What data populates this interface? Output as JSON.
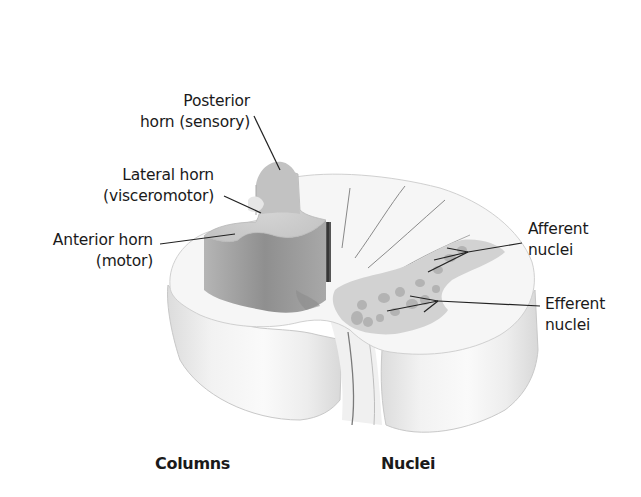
{
  "figure": {
    "labels": {
      "posterior_horn": [
        "Posterior",
        "horn (sensory)"
      ],
      "lateral_horn": [
        "Lateral horn",
        "(visceromotor)"
      ],
      "anterior_horn": [
        "Anterior horn",
        "(motor)"
      ],
      "afferent_nuclei": [
        "Afferent",
        "nuclei"
      ],
      "efferent_nuclei": [
        "Efferent",
        "nuclei"
      ]
    },
    "captions": {
      "left": "Columns",
      "right": "Nuclei"
    },
    "colors": {
      "white_matter": "#f4f4f4",
      "white_matter_side": "#e2e2e2",
      "gray_matter_top": "#cfcfcf",
      "gray_matter_side": "#9a9a9a",
      "nuclei": "#b0b0b0",
      "leader_lines": "#222222",
      "text": "#1a1a1a"
    }
  }
}
